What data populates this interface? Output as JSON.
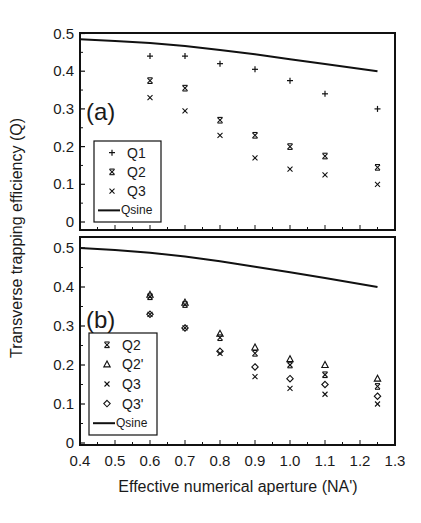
{
  "figure": {
    "ylabel": "Transverse trapping efficiency (Q)",
    "xlabel": "Effective numerical aperture (NA')",
    "x_tick_labels": [
      "0.4",
      "0.5",
      "0.6",
      "0.7",
      "0.8",
      "0.9",
      "1.0",
      "1.1",
      "1.2",
      "1.3"
    ],
    "y_tick_labels": [
      "0",
      "0.1",
      "0.2",
      "0.3",
      "0.4",
      "0.5"
    ]
  },
  "panels": [
    {
      "label": "(a)",
      "legend": [
        "Q1",
        "Q2",
        "Q3",
        "Qsine"
      ]
    },
    {
      "label": "(b)",
      "legend": [
        "Q2",
        "Q2'",
        "Q3",
        "Q3'",
        "Qsine"
      ]
    }
  ],
  "chart_data": [
    {
      "type": "scatter",
      "title": "(a)",
      "xlabel": "Effective numerical aperture (NA')",
      "ylabel": "Transverse trapping efficiency (Q)",
      "xlim": [
        0.4,
        1.3
      ],
      "ylim": [
        0,
        0.5
      ],
      "grid": false,
      "legend_position": "lower left",
      "x": [
        0.6,
        0.7,
        0.8,
        0.9,
        1.0,
        1.1,
        1.25
      ],
      "series": [
        {
          "name": "Q1",
          "marker": "plus",
          "values": [
            0.44,
            0.44,
            0.42,
            0.405,
            0.375,
            0.34,
            0.3
          ]
        },
        {
          "name": "Q2",
          "marker": "x-bar",
          "values": [
            0.375,
            0.355,
            0.27,
            0.23,
            0.2,
            0.175,
            0.145
          ]
        },
        {
          "name": "Q3",
          "marker": "x",
          "values": [
            0.33,
            0.295,
            0.23,
            0.17,
            0.14,
            0.125,
            0.1
          ]
        },
        {
          "name": "Qsine",
          "type": "line",
          "x": [
            0.4,
            0.5,
            0.6,
            0.7,
            0.8,
            0.9,
            1.0,
            1.1,
            1.25
          ],
          "values": [
            0.485,
            0.48,
            0.475,
            0.467,
            0.456,
            0.445,
            0.432,
            0.419,
            0.4
          ]
        }
      ]
    },
    {
      "type": "scatter",
      "title": "(b)",
      "xlabel": "Effective numerical aperture (NA')",
      "ylabel": "Transverse trapping efficiency (Q)",
      "xlim": [
        0.4,
        1.3
      ],
      "ylim": [
        0,
        0.5
      ],
      "grid": false,
      "legend_position": "lower left",
      "x": [
        0.6,
        0.7,
        0.8,
        0.9,
        1.0,
        1.1,
        1.25
      ],
      "series": [
        {
          "name": "Q2",
          "marker": "x-bar",
          "values": [
            0.375,
            0.355,
            0.27,
            0.23,
            0.2,
            0.175,
            0.145
          ]
        },
        {
          "name": "Q2'",
          "marker": "triangle",
          "values": [
            0.38,
            0.36,
            0.28,
            0.245,
            0.215,
            0.2,
            0.165
          ]
        },
        {
          "name": "Q3",
          "marker": "x",
          "values": [
            0.33,
            0.295,
            0.23,
            0.17,
            0.14,
            0.125,
            0.1
          ]
        },
        {
          "name": "Q3'",
          "marker": "diamond",
          "values": [
            0.33,
            0.295,
            0.235,
            0.195,
            0.165,
            0.15,
            0.12
          ]
        },
        {
          "name": "Qsine",
          "type": "line",
          "x": [
            0.4,
            0.5,
            0.6,
            0.7,
            0.8,
            0.9,
            1.0,
            1.1,
            1.25
          ],
          "values": [
            0.5,
            0.495,
            0.488,
            0.478,
            0.466,
            0.452,
            0.438,
            0.423,
            0.4
          ]
        }
      ]
    }
  ]
}
